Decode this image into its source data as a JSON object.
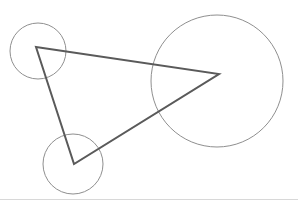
{
  "canvas": {
    "width": 298,
    "height": 208,
    "background_color": "#ffffff"
  },
  "figure": {
    "style": {
      "circle_stroke_color": "#8f8f8f",
      "circle_stroke_width": 1,
      "triangle_stroke_color": "#5a5a5a",
      "triangle_stroke_width": 2,
      "divider_color": "#d8d8d8",
      "divider_width": 1
    },
    "triangle": {
      "name": "triangle",
      "points": "36,47 219,74 74,164",
      "vertices": [
        {
          "label": "A",
          "x": 36,
          "y": 47
        },
        {
          "label": "B",
          "x": 219,
          "y": 74
        },
        {
          "label": "C",
          "x": 74,
          "y": 164
        }
      ]
    },
    "circles": [
      {
        "name": "circle-top-left",
        "cx": 38,
        "cy": 51,
        "r": 28
      },
      {
        "name": "circle-right-large",
        "cx": 217,
        "cy": 81,
        "r": 66
      },
      {
        "name": "circle-bottom-left",
        "cx": 73,
        "cy": 164,
        "r": 30
      }
    ],
    "divider": {
      "name": "bottom-divider",
      "x1": 0,
      "y1": 199,
      "x2": 298,
      "y2": 199
    }
  }
}
